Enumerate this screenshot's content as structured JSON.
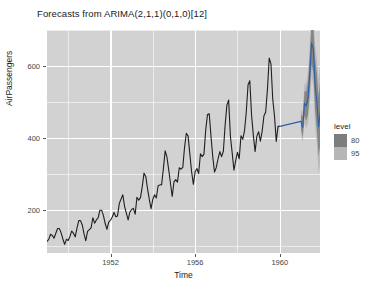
{
  "chart": {
    "title": "Forecasts from ARIMA(2,1,1)(0,1,0)[12]",
    "xlabel": "Time",
    "ylabel": "AirPassengers"
  },
  "legend": {
    "title": "level",
    "items": [
      {
        "label": "80",
        "color": "#7d7d7d"
      },
      {
        "label": "95",
        "color": "#b6b6b6"
      }
    ]
  },
  "axes": {
    "y_ticks": [
      "200",
      "400",
      "600"
    ],
    "x_ticks": [
      "1952",
      "1956",
      "1960"
    ]
  },
  "colors": {
    "panel": "#d2d2d2",
    "grid": "#ffffff",
    "line": "#1f1f1f",
    "text": "#1a1a1a",
    "tick_text": "#444444"
  },
  "chart_data": {
    "type": "line",
    "title": "Forecasts from ARIMA(2,1,1)(0,1,0)[12]",
    "xlabel": "Time",
    "ylabel": "AirPassengers",
    "xlim": [
      1949.0,
      1961.9
    ],
    "ylim": [
      80,
      700
    ],
    "grid": true,
    "legend_position": "right",
    "legend_title": "level",
    "x_ticks": [
      1952,
      1956,
      1960
    ],
    "y_ticks": [
      200,
      400,
      600
    ],
    "x_minor_ticks": [
      1950,
      1954,
      1958
    ],
    "y_minor_ticks": [
      100,
      300,
      500,
      700
    ],
    "series": [
      {
        "name": "AirPassengers",
        "type": "observed",
        "color": "#1f1f1f",
        "x_start": 1949.0,
        "x_step": 0.08333333,
        "values": [
          112,
          118,
          132,
          129,
          121,
          135,
          148,
          148,
          136,
          119,
          104,
          118,
          115,
          126,
          141,
          135,
          125,
          149,
          170,
          170,
          158,
          133,
          114,
          140,
          145,
          150,
          178,
          163,
          172,
          178,
          199,
          199,
          184,
          162,
          146,
          166,
          171,
          180,
          193,
          181,
          183,
          218,
          230,
          242,
          209,
          191,
          172,
          194,
          201,
          204,
          188,
          235,
          227,
          234,
          264,
          302,
          293,
          259,
          229,
          203,
          229,
          242,
          233,
          267,
          269,
          270,
          315,
          364,
          347,
          312,
          274,
          237,
          278,
          284,
          277,
          317,
          313,
          318,
          374,
          413,
          405,
          355,
          306,
          271,
          306,
          315,
          301,
          356,
          348,
          355,
          422,
          465,
          467,
          404,
          347,
          305,
          318,
          342,
          362,
          348,
          363,
          435,
          491,
          505,
          404,
          359,
          310,
          337,
          360,
          342,
          406,
          396,
          420,
          472,
          548,
          559,
          463,
          407,
          362,
          405,
          417,
          391,
          419,
          461,
          472,
          535,
          622,
          606,
          508,
          461,
          390,
          432,
          432
        ]
      },
      {
        "name": "Point Forecast",
        "type": "forecast",
        "color": "#2b5fa8",
        "x_start": 1961.0,
        "x_step": 0.08333333,
        "values": [
          446,
          429,
          496,
          489,
          512,
          577,
          664,
          648,
          549,
          502,
          431,
          473
        ]
      }
    ],
    "intervals": [
      {
        "level": 80,
        "color": "#7d7d7d",
        "lower": [
          425,
          401,
          462,
          448,
          465,
          524,
          605,
          583,
          478,
          425,
          348,
          384
        ],
        "upper": [
          467,
          457,
          530,
          530,
          559,
          630,
          723,
          713,
          620,
          579,
          514,
          562
        ]
      },
      {
        "level": 95,
        "color": "#b6b6b6",
        "lower": [
          414,
          386,
          443,
          427,
          440,
          495,
          572,
          547,
          438,
          381,
          300,
          333
        ],
        "upper": [
          478,
          472,
          549,
          551,
          584,
          659,
          756,
          749,
          660,
          623,
          562,
          613
        ]
      }
    ]
  }
}
